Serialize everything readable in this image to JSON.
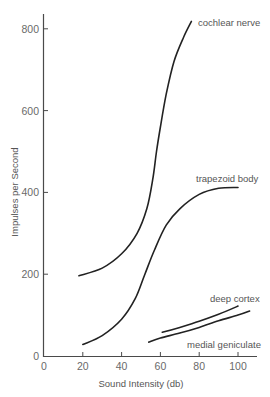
{
  "chart_data": {
    "type": "line",
    "title": "",
    "xlabel": "Sound Intensity (db)",
    "ylabel": "Impulses per Second",
    "xlim": [
      0,
      108
    ],
    "ylim": [
      0,
      840
    ],
    "xticks": [
      0,
      20,
      40,
      60,
      80,
      100
    ],
    "yticks": [
      0,
      200,
      400,
      600,
      800
    ],
    "grid": false,
    "legend": "inline labels at curve ends",
    "series": [
      {
        "name": "cochlear nerve",
        "x": [
          18,
          30,
          40,
          48,
          53,
          56,
          58,
          60,
          63,
          67,
          72,
          76
        ],
        "y": [
          196,
          215,
          250,
          300,
          360,
          430,
          500,
          560,
          640,
          720,
          780,
          818
        ]
      },
      {
        "name": "trapezoid body",
        "x": [
          20,
          30,
          40,
          47,
          52,
          57,
          63,
          70,
          80,
          90,
          100
        ],
        "y": [
          28,
          50,
          90,
          140,
          200,
          260,
          320,
          360,
          395,
          410,
          412
        ]
      },
      {
        "name": "deep cortex",
        "x": [
          61,
          70,
          80,
          90,
          100
        ],
        "y": [
          58,
          70,
          85,
          102,
          122
        ]
      },
      {
        "name": "medial geniculate",
        "x": [
          54,
          60,
          70,
          80,
          90,
          100,
          106
        ],
        "y": [
          34,
          44,
          56,
          70,
          86,
          100,
          110
        ]
      }
    ],
    "annotations": [
      {
        "text": "cochlear nerve",
        "x": 78,
        "y": 818
      },
      {
        "text": "trapezoid body",
        "x": 75,
        "y": 440
      },
      {
        "text": "deep cortex",
        "x": 82,
        "y": 142
      },
      {
        "text": "medial geniculate",
        "x": 75,
        "y": 28
      }
    ]
  },
  "labels": {
    "xlabel": "Sound Intensity (db)",
    "ylabel": "Impulses per Second",
    "x_ticks": [
      "0",
      "20",
      "40",
      "60",
      "80",
      "100"
    ],
    "y_ticks": [
      "0",
      "200",
      "400",
      "600",
      "800"
    ],
    "series": [
      "cochlear nerve",
      "trapezoid body",
      "deep cortex",
      "medial geniculate"
    ]
  },
  "colors": {
    "curve": "#222222",
    "axis": "#4a4a4a",
    "text": "#666666",
    "background": "#ffffff"
  }
}
